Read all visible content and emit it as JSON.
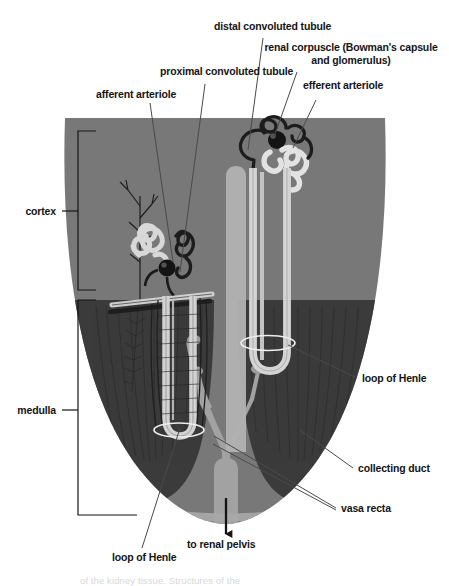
{
  "figure": {
    "colors": {
      "cortex_fill": "#787878",
      "medulla_fill": "#3b3b3b",
      "pelvis_fill": "#a2a2a2",
      "tubule_light": "#d8d8d8",
      "tubule_outline": "#2b2b2b",
      "glomerulus_dark": "#1a1a1a",
      "leader_line": "#555555",
      "text": "#141414",
      "background": "#ffffff"
    }
  },
  "region_labels": [
    {
      "id": "cortex",
      "text": "cortex"
    },
    {
      "id": "medulla",
      "text": "medulla"
    }
  ],
  "callouts": [
    {
      "id": "distal-convoluted-tubule",
      "text": "distal convoluted tubule"
    },
    {
      "id": "renal-corpuscle",
      "text": "renal corpuscle (Bowman's capsule and glomerulus)"
    },
    {
      "id": "renal-corpuscle-line1",
      "text": "renal corpuscle (Bowman's capsule"
    },
    {
      "id": "renal-corpuscle-line2",
      "text": "and glomerulus)"
    },
    {
      "id": "proximal-convoluted-tubule",
      "text": "proximal convoluted tubule"
    },
    {
      "id": "efferent-arteriole",
      "text": "efferent arteriole"
    },
    {
      "id": "afferent-arteriole",
      "text": "afferent arteriole"
    },
    {
      "id": "loop-of-henle-right",
      "text": "loop of Henle"
    },
    {
      "id": "collecting-duct",
      "text": "collecting duct"
    },
    {
      "id": "vasa-recta",
      "text": "vasa recta"
    },
    {
      "id": "loop-of-henle-left",
      "text": "loop of Henle"
    },
    {
      "id": "to-renal-pelvis",
      "text": "to renal pelvis"
    }
  ],
  "caption": {
    "text": "of the kidney tissue. Structures of the"
  }
}
